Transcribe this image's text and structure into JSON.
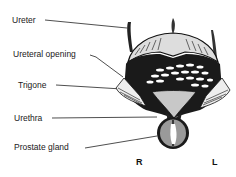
{
  "diagram": {
    "labels": [
      {
        "id": "ureter",
        "text": "Ureter"
      },
      {
        "id": "ureteral_opening",
        "text": "Ureteral opening"
      },
      {
        "id": "trigone",
        "text": "Trigone"
      },
      {
        "id": "urethra",
        "text": "Urethra"
      },
      {
        "id": "prostate_gland",
        "text": "Prostate gland"
      }
    ],
    "orientation": {
      "right": "R",
      "left": "L"
    }
  }
}
